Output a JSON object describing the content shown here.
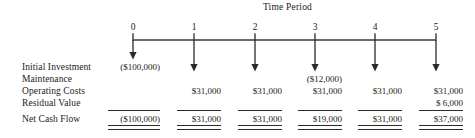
{
  "title": "Time Period",
  "periods": [
    "0",
    "1",
    "2",
    "3",
    "4",
    "5"
  ],
  "rows": [
    {
      "label": "Initial Investment"
    },
    {
      "label": "Maintenance"
    },
    {
      "label": "Operating Costs"
    },
    {
      "label": "Residual Value"
    },
    {
      "label": "Net Cash Flow"
    }
  ],
  "cells": {
    "initial_investment": [
      "($100,000)",
      "",
      "",
      "",
      "",
      ""
    ],
    "maintenance": [
      "",
      "",
      "",
      "($12,000)",
      "",
      ""
    ],
    "operating_costs": [
      "",
      "$31,000",
      "$31,000",
      "$31,000",
      "$31,000",
      "$31,000"
    ],
    "residual_value": [
      "",
      "",
      "",
      "",
      "",
      "$  6,000"
    ],
    "net_cash_flow": [
      "($100,000)",
      "$31,000",
      "$31,000",
      "$19,000",
      "$31,000",
      "$37,000"
    ]
  },
  "colors": {
    "ink": "#1a1a1a",
    "rule": "#2a2a2a",
    "axis": "#3a3a3a"
  },
  "chart_data": {
    "type": "table",
    "title": "Time Period",
    "xlabel": "Time Period",
    "ylabel": "",
    "categories": [
      "0",
      "1",
      "2",
      "3",
      "4",
      "5"
    ],
    "series": [
      {
        "name": "Initial Investment",
        "values": [
          -100000,
          null,
          null,
          null,
          null,
          null
        ]
      },
      {
        "name": "Maintenance",
        "values": [
          null,
          null,
          null,
          -12000,
          null,
          null
        ]
      },
      {
        "name": "Operating Costs",
        "values": [
          null,
          31000,
          31000,
          31000,
          31000,
          31000
        ]
      },
      {
        "name": "Residual Value",
        "values": [
          null,
          null,
          null,
          null,
          null,
          6000
        ]
      },
      {
        "name": "Net Cash Flow",
        "values": [
          -100000,
          31000,
          31000,
          19000,
          31000,
          37000
        ]
      }
    ],
    "grid": false,
    "legend": "none",
    "annotations": [
      "Downward arrow at each time period 0 through 5",
      "Single rule above Net Cash Flow totals, double rule below"
    ]
  }
}
